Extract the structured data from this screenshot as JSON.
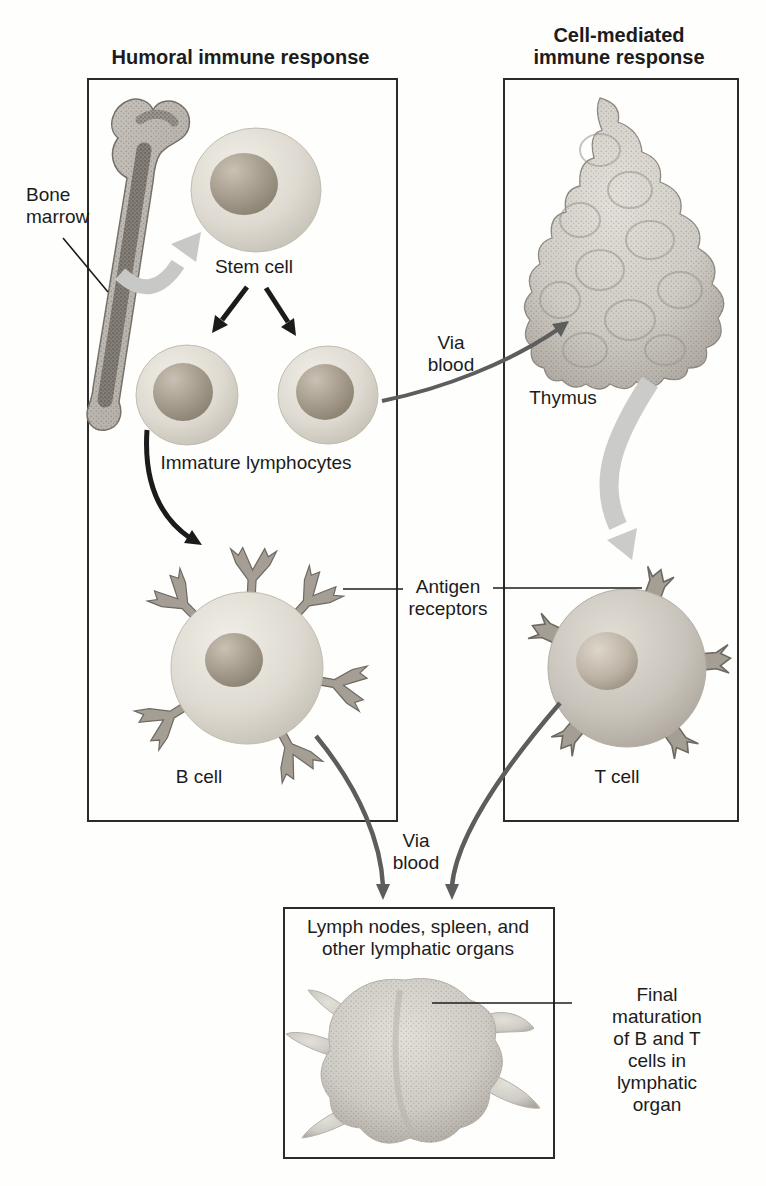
{
  "figure": {
    "type": "immune-cell-development-diagram",
    "panels": {
      "humoral": {
        "title": "Humoral immune response"
      },
      "cell_mediated": {
        "title": "Cell-mediated\nimmune response"
      },
      "lymphatic": {
        "caption": "Lymph nodes, spleen, and\nother lymphatic organs"
      }
    },
    "labels": {
      "bone_marrow": "Bone\nmarrow",
      "stem_cell": "Stem cell",
      "immature_lymphocytes": "Immature lymphocytes",
      "b_cell": "B cell",
      "t_cell": "T cell",
      "thymus": "Thymus",
      "via_blood_top": "Via\nblood",
      "via_blood_bottom": "Via\nblood",
      "antigen_receptors": "Antigen\nreceptors",
      "final_maturation": "Final maturation\nof B and T cells in\nlymphatic organ"
    },
    "colors": {
      "ink": "#1c1c1c",
      "box_border": "#2b2b2b",
      "cell_body": "#dedad1",
      "cell_nucleus": "#a79d8e",
      "t_cell_body": "#c6c1b8",
      "receptor": "#a49e94",
      "organ_gray": "#cfccc5",
      "thick_arrow_gray": "#c8c8c6",
      "thin_arrow_gray": "#5d5d5d",
      "black_arrow": "#1b1b1b"
    }
  }
}
